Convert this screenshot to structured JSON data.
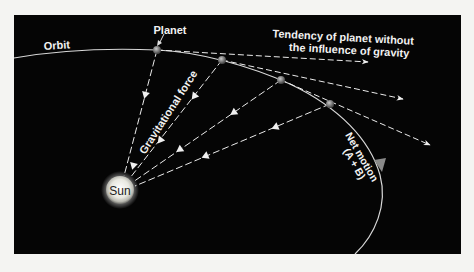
{
  "diagram": {
    "labels": {
      "orbit": "Orbit",
      "planet": "Planet",
      "tendency_line1": "Tendency of planet without",
      "tendency_line2": "the influence of gravity",
      "gravitational_force": "Gravitational force",
      "net_motion_line1": "Net motion",
      "net_motion_line2": "(A + B)",
      "sun": "Sun"
    },
    "colors": {
      "background": "#050505",
      "page": "#f4f4f2",
      "lines": "#e8e8e8",
      "sun": "#f0f0ea",
      "planet": "#6a6a6a",
      "net_motion_arrow": "#8a8a8a"
    },
    "nodes": [
      {
        "id": "sun",
        "label": "Sun",
        "x": 120,
        "y": 190
      },
      {
        "id": "planet-1",
        "x": 157,
        "y": 50
      },
      {
        "id": "planet-2",
        "x": 222,
        "y": 60
      },
      {
        "id": "planet-3",
        "x": 281,
        "y": 80
      },
      {
        "id": "planet-4",
        "x": 330,
        "y": 104
      }
    ],
    "edges": [
      {
        "from": "planet-1",
        "to": "sun",
        "type": "gravitational-force"
      },
      {
        "from": "planet-2",
        "to": "sun",
        "type": "gravitational-force"
      },
      {
        "from": "planet-3",
        "to": "sun",
        "type": "gravitational-force"
      },
      {
        "from": "planet-4",
        "to": "sun",
        "type": "gravitational-force"
      },
      {
        "from": "planet-1",
        "to": "tangent-1",
        "type": "inertial-tendency"
      },
      {
        "from": "planet-2",
        "to": "tangent-2",
        "type": "inertial-tendency"
      },
      {
        "from": "planet-3",
        "to": "tangent-3",
        "type": "inertial-tendency"
      }
    ]
  }
}
